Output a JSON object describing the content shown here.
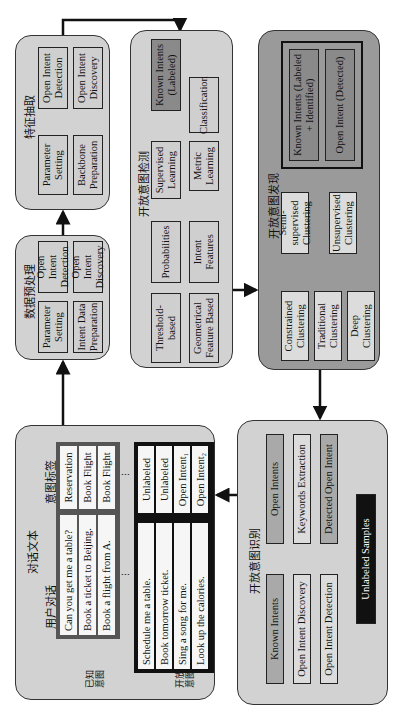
{
  "dialog_panel": {
    "title": "对话文本",
    "col_user": "用户对话",
    "col_label": "意图标签",
    "known_label": "已知\n意图",
    "open_label": "开放\n意图",
    "known_rows": [
      {
        "text": "Can you get me a table?",
        "label": "Reservation"
      },
      {
        "text": "Book a ticket to Beijing.",
        "label": "Book Flight"
      },
      {
        "text": "Book a flight from A.",
        "label": "Book Flight"
      }
    ],
    "open_rows": [
      {
        "text": "Schedule me a table.",
        "label": "Unlabeled"
      },
      {
        "text": "Book tomorrow ticket.",
        "label": "Unlabeled"
      },
      {
        "text": "Sing a song for me.",
        "label": "Open Intent₁"
      },
      {
        "text": "Look up the calories.",
        "label": "Open Intent₂"
      }
    ],
    "ellipsis": "⋮"
  },
  "preprocess_panel": {
    "title": "数据预处理",
    "param": "Parameter Setting",
    "prep": "Intent Data Preparation",
    "detect": "Open Intent Detection",
    "discover": "Open Intent Discovery"
  },
  "feature_panel": {
    "title": "特征抽取",
    "param": "Parameter Setting",
    "prep": "Backbone Preparation",
    "detect": "Open Intent Detection",
    "discover": "Open Intent Discovery"
  },
  "detection_panel": {
    "title": "开放意图检测",
    "known": "Known Intents (Labeled)",
    "supervised": "Supervised Learning",
    "classification": "Classification",
    "metric": "Metric Learning",
    "probabilities": "Probabilities",
    "features": "Intent Features",
    "threshold": "Threshold-based",
    "geometric": "Geometrical Feature Based"
  },
  "discovery_panel": {
    "title": "开放意图发现",
    "known": "Known Intents (Labeled + Identified)",
    "open": "Open Intent (Detected)",
    "semi": "Semi-supervised Clustering",
    "unsup": "Unsupervised Clustering",
    "constrained": "Constrained Clustering",
    "traditional": "Traditional Clustering",
    "deep": "Deep Clustering"
  },
  "recognition_panel": {
    "title": "开放意图识别",
    "known": "Known Intents",
    "open": "Open Intents",
    "discovery": "Open Intent Discovery",
    "keywords": "Keywords Extraction",
    "detection": "Open Intent Detection",
    "detected": "Detected Open Intent",
    "unlabeled": "Unlabeled Samples"
  },
  "colors": {
    "panel": "#d2d2d2",
    "panel_dark": "#9a9a9a",
    "box_mid": "#a9a9a9",
    "box_dark": "#8a8a8a",
    "black": "#111111"
  }
}
